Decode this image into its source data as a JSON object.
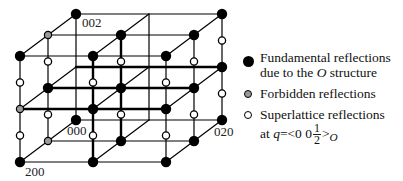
{
  "figure": {
    "type": "reciprocal-lattice diagram",
    "labels": {
      "origin": "000",
      "a_axis": "200",
      "b_axis": "020",
      "c_axis": "002"
    },
    "colors": {
      "fundamental": "#000000",
      "forbidden": "#9a9a9a",
      "superlattice": "#ffffff",
      "line": "#000000"
    }
  },
  "legend": {
    "fundamental": {
      "line1": "Fundamental reflections",
      "line2_prefix": "due to the ",
      "line2_italic": "O",
      "line2_suffix": " structure"
    },
    "forbidden": {
      "label": "Forbidden reflections"
    },
    "superlattice": {
      "line1": "Superlattice reflections",
      "at": "at ",
      "q": "q",
      "eq": "=<0 0",
      "frac_num": "1",
      "frac_den": "2",
      "close": ">",
      "sub": "O"
    }
  }
}
